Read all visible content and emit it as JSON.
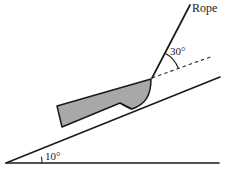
{
  "figure": {
    "type": "physics-free-body-diagram",
    "title_text": "",
    "background_color": "#ffffff",
    "stroke_color": "#1a1a1a",
    "block_fill_color": "#a8a8a8",
    "dash_color": "#2b2b2b"
  },
  "labels": {
    "rope": "Rope",
    "rope_angle": "30°",
    "incline_angle": "10°"
  },
  "geometry": {
    "ground": {
      "x1": 6,
      "y1": 163,
      "x2": 219,
      "y2": 163
    },
    "incline": {
      "x1": 6,
      "y1": 163,
      "x2": 220,
      "y2": 77
    },
    "incline_angle_deg": 10,
    "rope": {
      "x1": 152,
      "y1": 78,
      "x2": 190,
      "y2": 5
    },
    "rope_angle_from_incline_deg": 30,
    "dashed_reference": {
      "x1": 152,
      "y1": 78,
      "x2": 213,
      "y2": 56
    },
    "block": {
      "bottom_left": {
        "x": 62,
        "y": 127
      },
      "top_left": {
        "x": 57,
        "y": 106
      },
      "top_right": {
        "x": 151,
        "y": 79
      },
      "curve_end": {
        "x": 120,
        "y": 103
      }
    },
    "angle_arc_incline": {
      "cx": 6,
      "cy": 163,
      "radius": 36
    },
    "angle_arc_rope": {
      "cx": 152,
      "cy": 78,
      "radius": 28
    }
  }
}
